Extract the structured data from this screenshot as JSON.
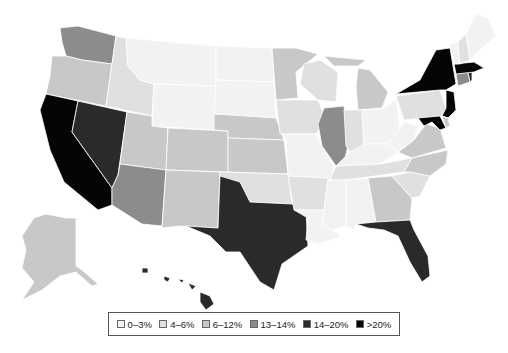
{
  "legend": {
    "items": [
      {
        "label": "0–3%",
        "color": "#f2f2f2"
      },
      {
        "label": "4–6%",
        "color": "#e0e0e0"
      },
      {
        "label": "6–12%",
        "color": "#c8c8c8"
      },
      {
        "label": "13–14%",
        "color": "#8c8c8c"
      },
      {
        "label": "14–20%",
        "color": "#2a2a2a"
      },
      {
        "label": ">20%",
        "color": "#050505"
      }
    ]
  },
  "states": {
    "WA": "13–14%",
    "OR": "6–12%",
    "CA": ">20%",
    "NV": "14–20%",
    "ID": "4–6%",
    "MT": "0–3%",
    "WY": "0–3%",
    "UT": "6–12%",
    "AZ": "13–14%",
    "CO": "6–12%",
    "NM": "6–12%",
    "ND": "0–3%",
    "SD": "0–3%",
    "NE": "6–12%",
    "KS": "6–12%",
    "OK": "4–6%",
    "TX": "14–20%",
    "MN": "6–12%",
    "IA": "4–6%",
    "MO": "0–3%",
    "AR": "4–6%",
    "LA": "0–3%",
    "WI": "4–6%",
    "IL": "13–14%",
    "MI": "6–12%",
    "IN": "4–6%",
    "OH": "0–3%",
    "KY": "0–3%",
    "TN": "4–6%",
    "MS": "0–3%",
    "AL": "0–3%",
    "GA": "6–12%",
    "FL": "14–20%",
    "SC": "4–6%",
    "NC": "6–12%",
    "VA": "6–12%",
    "WV": "0–3%",
    "PA": "4–6%",
    "NY": ">20%",
    "NJ": ">20%",
    "MD": ">20%",
    "DE": "6–12%",
    "CT": "13–14%",
    "RI": "14–20%",
    "MA": ">20%",
    "VT": "0–3%",
    "NH": "4–6%",
    "ME": "0–3%",
    "AK": "6–12%",
    "HI": "14–20%"
  }
}
